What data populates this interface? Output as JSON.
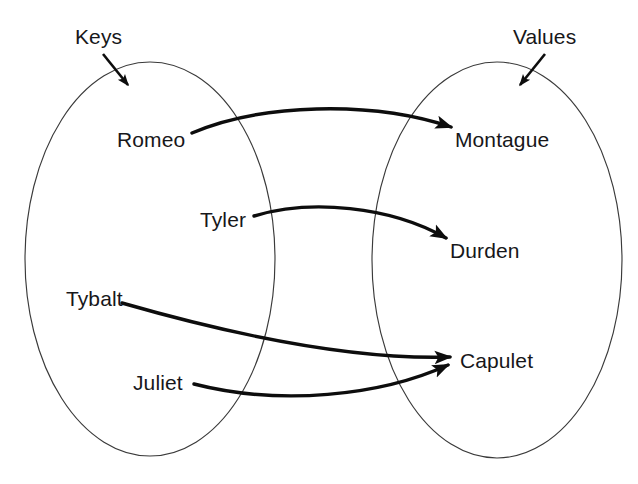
{
  "diagram": {
    "type": "set-mapping-diagram",
    "title_text": "",
    "background_color": "#ffffff",
    "stroke_color": "#0d0d0d",
    "outline_color": "#3a3a3a",
    "text_color": "#17171a",
    "sets": [
      {
        "id": "keys",
        "label": "Keys",
        "label_x": 75,
        "label_y": 26,
        "ellipse": {
          "cx": 150,
          "cy": 259,
          "rx": 125,
          "ry": 197
        },
        "pointer": {
          "from_x": 103,
          "from_y": 54,
          "to_x": 128,
          "to_y": 85
        }
      },
      {
        "id": "values",
        "label": "Values",
        "label_x": 513,
        "label_y": 26,
        "ellipse": {
          "cx": 497,
          "cy": 260,
          "rx": 125,
          "ry": 198
        },
        "pointer": {
          "from_x": 545,
          "from_y": 54,
          "to_x": 520,
          "to_y": 85
        }
      }
    ],
    "keys": [
      {
        "id": "romeo",
        "label": "Romeo",
        "x": 117,
        "y": 129
      },
      {
        "id": "tyler",
        "label": "Tyler",
        "x": 200,
        "y": 209
      },
      {
        "id": "tybalt",
        "label": "Tybalt",
        "x": 66,
        "y": 288
      },
      {
        "id": "juliet",
        "label": "Juliet",
        "x": 133,
        "y": 372
      }
    ],
    "values": [
      {
        "id": "montague",
        "label": "Montague",
        "x": 455,
        "y": 129
      },
      {
        "id": "durden",
        "label": "Durden",
        "x": 450,
        "y": 240
      },
      {
        "id": "capulet",
        "label": "Capulet",
        "x": 460,
        "y": 350
      }
    ],
    "mappings": [
      {
        "id": "romeo-to-montague",
        "from": "Romeo",
        "to": "Montague",
        "path": "M 192 133 C 260 104, 370 100, 451 127"
      },
      {
        "id": "tyler-to-durden",
        "from": "Tyler",
        "to": "Durden",
        "path": "M 254 216 C 310 199, 390 206, 446 238"
      },
      {
        "id": "tybalt-to-capulet",
        "from": "Tybalt",
        "to": "Capulet",
        "path": "M 122 303 C 230 334, 352 360, 450 357"
      },
      {
        "id": "juliet-to-capulet",
        "from": "Juliet",
        "to": "Capulet",
        "path": "M 194 384 C 280 406, 380 396, 448 365"
      }
    ]
  }
}
